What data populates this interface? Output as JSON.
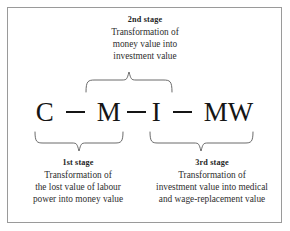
{
  "figure": {
    "type": "process-diagram",
    "border_color": "#9a9a9a",
    "background_color": "#ffffff",
    "text_color": "#2b2b2b"
  },
  "formula": {
    "terms": [
      "C",
      "M",
      "I",
      "MW"
    ],
    "connector": "—",
    "full": "C — M — I — MW"
  },
  "stages": {
    "second": {
      "title": "2nd stage",
      "lines": [
        "Transformation of",
        "money value into",
        "investment value"
      ]
    },
    "first": {
      "title": "1st stage",
      "lines": [
        "Transformation of",
        "the lost value of labour",
        "power into money value"
      ]
    },
    "third": {
      "title": "3rd stage",
      "lines": [
        "Transformation of",
        "investment value into medical",
        "and wage-replacement value"
      ]
    }
  }
}
